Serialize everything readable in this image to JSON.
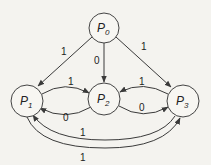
{
  "diagram": {
    "type": "state-transition-graph",
    "nodes": [
      {
        "id": "P0",
        "base": "P",
        "sub": "0"
      },
      {
        "id": "P1",
        "base": "P",
        "sub": "1"
      },
      {
        "id": "P2",
        "base": "P",
        "sub": "2"
      },
      {
        "id": "P3",
        "base": "P",
        "sub": "3"
      }
    ],
    "edges": [
      {
        "from": "P0",
        "to": "P1",
        "label": "1"
      },
      {
        "from": "P0",
        "to": "P2",
        "label": "0"
      },
      {
        "from": "P0",
        "to": "P3",
        "label": "1"
      },
      {
        "from": "P1",
        "to": "P2",
        "label": "1"
      },
      {
        "from": "P2",
        "to": "P1",
        "label": "0"
      },
      {
        "from": "P3",
        "to": "P2",
        "label": "1"
      },
      {
        "from": "P2",
        "to": "P3",
        "label": "0"
      },
      {
        "from": "P1",
        "to": "P3",
        "label": "1"
      },
      {
        "from": "P3",
        "to": "P1",
        "label": "1"
      }
    ],
    "colors": {
      "stroke": "#3a3a3a",
      "background": "#f4f3ef"
    }
  }
}
